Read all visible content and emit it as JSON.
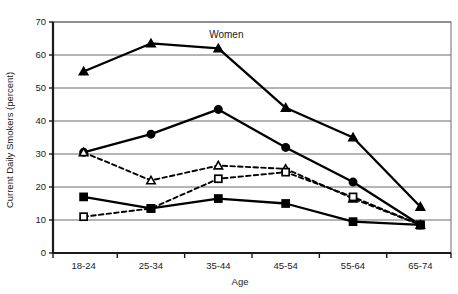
{
  "chart_data": {
    "type": "line",
    "title": "",
    "xlabel": "Age",
    "ylabel": "Current Daily Smokers (percent)",
    "categories": [
      "18-24",
      "25-34",
      "35-44",
      "45-54",
      "55-64",
      "65-74"
    ],
    "ylim": [
      0,
      70
    ],
    "yticks": [
      0,
      10,
      20,
      30,
      40,
      50,
      60,
      70
    ],
    "grid": "horizontal",
    "legend": "none",
    "annotations": [
      {
        "text": "Women",
        "x_category": "35-44",
        "y_value": 66
      }
    ],
    "series": [
      {
        "name": "series-1",
        "marker": "filled-triangle",
        "line": "solid",
        "color": "#000000",
        "values": [
          55,
          63.5,
          62,
          44,
          35,
          14
        ]
      },
      {
        "name": "series-2",
        "marker": "filled-circle",
        "line": "solid",
        "color": "#000000",
        "values": [
          30.5,
          36,
          43.5,
          32,
          21.5,
          8.5
        ]
      },
      {
        "name": "series-3",
        "marker": "open-triangle",
        "line": "dashed",
        "color": "#000000",
        "values": [
          30.5,
          22,
          26.5,
          25.5,
          16.5,
          8.5
        ]
      },
      {
        "name": "series-4",
        "marker": "open-square",
        "line": "dashed",
        "color": "#000000",
        "values": [
          11,
          13.5,
          22.5,
          24.5,
          17,
          8.5
        ]
      },
      {
        "name": "series-5",
        "marker": "filled-square",
        "line": "solid",
        "color": "#000000",
        "values": [
          17,
          13.5,
          16.5,
          15,
          9.5,
          8.5
        ]
      }
    ]
  },
  "axes": {
    "y_tick_labels": [
      "0",
      "10",
      "20",
      "30",
      "40",
      "50",
      "60",
      "70"
    ],
    "x_tick_labels": [
      "18-24",
      "25-34",
      "35-44",
      "45-54",
      "55-64",
      "65-74"
    ],
    "x_axis_title": "Age",
    "y_axis_title": "Current Daily Smokers (percent)"
  },
  "annotation": {
    "women_label": "Women"
  },
  "colors": {
    "plot_border": "#6b6b6b",
    "gridline": "#6b6b6b",
    "series_line": "#000000",
    "text": "#1a1a1a",
    "background": "#ffffff"
  }
}
